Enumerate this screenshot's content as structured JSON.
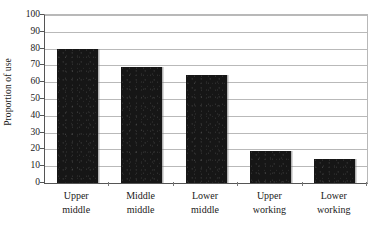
{
  "chart_data": {
    "type": "bar",
    "title": "",
    "subtitle": "",
    "xlabel": "",
    "ylabel": "Proportion of use",
    "categories": [
      "Upper middle",
      "Middle middle",
      "Lower middle",
      "Upper working",
      "Lower working"
    ],
    "category_lines": [
      {
        "line1": "Upper",
        "line2": "middle"
      },
      {
        "line1": "Middle",
        "line2": "middle"
      },
      {
        "line1": "Lower",
        "line2": "middle"
      },
      {
        "line1": "Upper",
        "line2": "working"
      },
      {
        "line1": "Lower",
        "line2": "working"
      }
    ],
    "values": [
      80,
      69,
      64,
      19,
      14
    ],
    "ylim": [
      0,
      100
    ],
    "ytick_step": 10,
    "ytick_labels": [
      "100",
      "90",
      "80",
      "70",
      "60",
      "50",
      "40",
      "30",
      "20",
      "10",
      "0"
    ],
    "ytick_values": [
      100,
      90,
      80,
      70,
      60,
      50,
      40,
      30,
      20,
      10,
      0
    ],
    "grid": "horizontal",
    "legend": "none",
    "bar_color": "#161616",
    "gridline_color": "#b9b9b9",
    "axis_color": "#555555",
    "background_color": "#ffffff"
  }
}
